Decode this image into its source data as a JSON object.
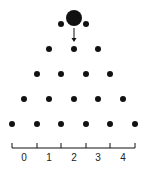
{
  "diagram": {
    "type": "galton-board",
    "ball": {
      "cx": 74,
      "cy": 18,
      "r": 8
    },
    "peg_radius": 3,
    "arrow": {
      "x": 74,
      "y1": 28,
      "y2": 42
    },
    "rows": [
      [
        61,
        86
      ],
      [
        49,
        74,
        98
      ],
      [
        37,
        61,
        86,
        110
      ],
      [
        24,
        49,
        74,
        98,
        123
      ],
      [
        12,
        37,
        61,
        86,
        110,
        135
      ]
    ],
    "row_y": [
      24,
      49,
      74,
      99,
      124
    ],
    "axis": {
      "y": 148,
      "ticks": [
        12,
        37,
        61,
        86,
        110,
        135
      ],
      "tick_top": 143
    },
    "bins": [
      {
        "label": "0",
        "x": 24
      },
      {
        "label": "1",
        "x": 49
      },
      {
        "label": "2",
        "x": 74
      },
      {
        "label": "3",
        "x": 98
      },
      {
        "label": "4",
        "x": 123
      }
    ],
    "color": "#111111"
  }
}
